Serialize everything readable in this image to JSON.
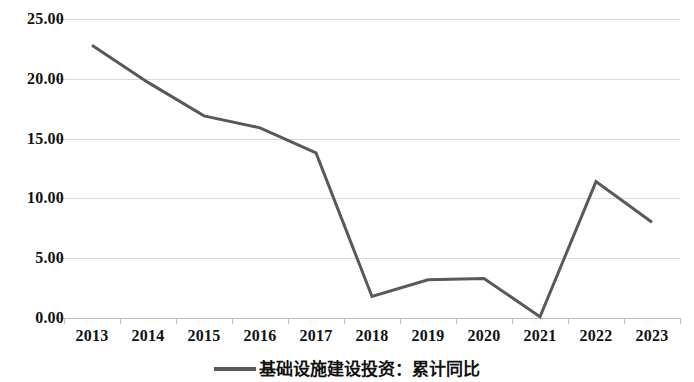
{
  "chart_data": {
    "type": "line",
    "title": "",
    "subtitle": "",
    "xlabel": "",
    "ylabel": "",
    "categories": [
      "2013",
      "2014",
      "2015",
      "2016",
      "2017",
      "2018",
      "2019",
      "2020",
      "2021",
      "2022",
      "2023"
    ],
    "series": [
      {
        "name": "基础设施建设投资：累计同比",
        "color": "#595959",
        "values": [
          22.8,
          19.7,
          16.9,
          15.9,
          13.8,
          1.8,
          3.2,
          3.3,
          0.1,
          11.4,
          8.0
        ]
      }
    ],
    "ylim": [
      0,
      25
    ],
    "yticks": [
      0,
      5,
      10,
      15,
      20,
      25
    ],
    "ytick_labels": [
      "0.00",
      "5.00",
      "10.00",
      "15.00",
      "20.00",
      "25.00"
    ],
    "grid": true,
    "legend_position": "bottom",
    "legend_entries": [
      "基础设施建设投资：累计同比"
    ]
  },
  "axes": {
    "y_labels": [
      "25.00",
      "20.00",
      "15.00",
      "10.00",
      "5.00",
      "0.00"
    ],
    "x_labels": [
      "2013",
      "2014",
      "2015",
      "2016",
      "2017",
      "2018",
      "2019",
      "2020",
      "2021",
      "2022",
      "2023"
    ]
  },
  "legend": {
    "label": "基础设施建设投资：累计同比",
    "swatch_color": "#595959"
  },
  "colors": {
    "line": "#595959",
    "gridline": "#d9d9d9",
    "axis": "#bfbfbf",
    "text": "#111111",
    "background": "#ffffff"
  }
}
